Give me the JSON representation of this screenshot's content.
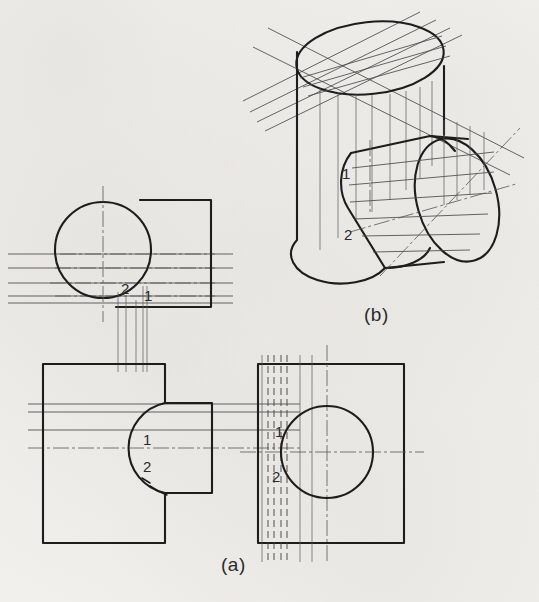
{
  "figure": {
    "ink_color": "#1d1d1d",
    "thin_color": "#555555",
    "paper_color": "#f2f1ee",
    "captions": [
      {
        "id": "caption-a",
        "text": "(a)",
        "x": 221,
        "y": 562,
        "note": "three orthographic views"
      },
      {
        "id": "caption-b",
        "text": "(b)",
        "x": 368,
        "y": 316,
        "note": "isometric pictorial view"
      }
    ]
  },
  "point_labels": [
    {
      "id": "top-view-label-2",
      "text": "2",
      "x": 126,
      "y": 288,
      "view": "top-view"
    },
    {
      "id": "top-view-label-1",
      "text": "1",
      "x": 147,
      "y": 296,
      "view": "top-view"
    },
    {
      "id": "front-view-label-1",
      "text": "1",
      "x": 145,
      "y": 440,
      "view": "front-view"
    },
    {
      "id": "front-view-label-2",
      "text": "2",
      "x": 147,
      "y": 467,
      "view": "front-view"
    },
    {
      "id": "side-view-label-1",
      "text": "1",
      "x": 277,
      "y": 432,
      "view": "side-view"
    },
    {
      "id": "side-view-label-2",
      "text": "2",
      "x": 276,
      "y": 477,
      "view": "side-view"
    },
    {
      "id": "pictorial-label-1",
      "text": "1",
      "x": 344,
      "y": 174,
      "view": "pictorial"
    },
    {
      "id": "pictorial-label-2",
      "text": "2",
      "x": 348,
      "y": 235,
      "view": "pictorial"
    }
  ],
  "views": {
    "top_view": {
      "name": "top-view",
      "circle": {
        "cx": 103,
        "cy": 250,
        "r": 48
      },
      "rect": {
        "x": 140,
        "y": 200,
        "w": 71,
        "h": 107
      },
      "center_line_vertical": {
        "x": 103,
        "y1": 186,
        "y2": 320
      },
      "horizontal_trace_lines_y": [
        254,
        268,
        283,
        296,
        303
      ],
      "horizontal_trace_x1": 8,
      "horizontal_trace_x2": 233
    },
    "front_view": {
      "name": "front-view",
      "main_rect": {
        "x": 43,
        "y": 364,
        "w": 122,
        "h": 179
      },
      "step_rect": {
        "x": 165,
        "y": 403,
        "w": 47,
        "h": 90
      },
      "notch_arc": {
        "cx": 186,
        "cy": 448,
        "r": 46
      },
      "center_line_horizontal": {
        "y": 448,
        "x1": 28,
        "x2": 236
      },
      "projector_x": [
        118,
        126,
        136,
        143,
        147
      ],
      "projector_y_top": 307,
      "projector_y_bottom": 410
    },
    "side_view": {
      "name": "side-view",
      "rect": {
        "x": 258,
        "y": 364,
        "w": 146,
        "h": 179
      },
      "circle": {
        "cx": 327,
        "cy": 452,
        "r": 46
      },
      "center_line_horizontal": {
        "y": 452,
        "x1": 240,
        "x2": 424
      },
      "center_line_vertical": {
        "x": 327,
        "y1": 345,
        "y2": 562
      },
      "hidden_lines_x": [
        268,
        273,
        280,
        286
      ],
      "visible_lines_x": [
        300,
        312
      ]
    },
    "pictorial": {
      "name": "pictorial-view",
      "vertical_cylinder": {
        "top_ellipse": {
          "cx": 370,
          "cy": 58,
          "rx": 75,
          "ry": 37,
          "rot": -8
        },
        "left_wall_x": 296,
        "right_wall_x": 444,
        "bottom_y": 272
      },
      "horizontal_cylinder": {
        "front_ellipse": {
          "cx": 460,
          "cy": 208,
          "rx": 40,
          "ry": 62,
          "rot": -16
        },
        "back_point": {
          "x": 355,
          "y": 150
        }
      }
    }
  }
}
